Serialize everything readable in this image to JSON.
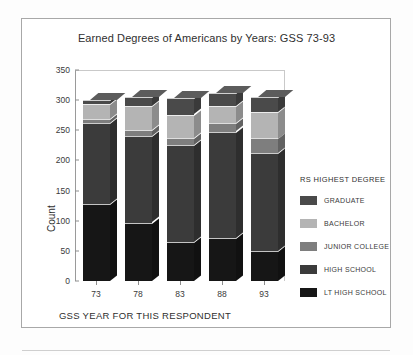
{
  "figure": {
    "title": "Earned Degrees of Americans by Years: GSS 73-93"
  },
  "legend": {
    "title": "RS HIGHEST DEGREE",
    "entries": [
      {
        "label": "GRADUATE",
        "color": "#4a4a4a"
      },
      {
        "label": "BACHELOR",
        "color": "#b4b4b4"
      },
      {
        "label": "JUNIOR COLLEGE",
        "color": "#7e7e7e"
      },
      {
        "label": "HIGH SCHOOL",
        "color": "#3b3b3b"
      },
      {
        "label": "LT HIGH SCHOOL",
        "color": "#161616"
      }
    ]
  },
  "chart_data": {
    "type": "bar",
    "stacked": true,
    "title": "Earned Degrees of Americans by Years: GSS 73-93",
    "xlabel": "GSS YEAR FOR THIS RESPONDENT",
    "ylabel": "Count",
    "categories": [
      "73",
      "78",
      "83",
      "88",
      "93"
    ],
    "ylim": [
      0,
      350
    ],
    "yticks": [
      0,
      50,
      100,
      150,
      200,
      250,
      300,
      350
    ],
    "grid": false,
    "legend_position": "right",
    "series": [
      {
        "name": "LT HIGH SCHOOL",
        "color": "#161616",
        "values": [
          127,
          97,
          65,
          72,
          49
        ]
      },
      {
        "name": "HIGH SCHOOL",
        "color": "#3b3b3b",
        "values": [
          135,
          143,
          161,
          176,
          163
        ]
      },
      {
        "name": "JUNIOR COLLEGE",
        "color": "#7e7e7e",
        "values": [
          6,
          10,
          12,
          14,
          25
        ]
      },
      {
        "name": "BACHELOR",
        "color": "#b4b4b4",
        "values": [
          25,
          40,
          38,
          29,
          44
        ]
      },
      {
        "name": "GRADUATE",
        "color": "#4a4a4a",
        "values": [
          7,
          15,
          27,
          21,
          25
        ]
      }
    ],
    "totals": [
      300,
      305,
      303,
      312,
      306
    ]
  }
}
